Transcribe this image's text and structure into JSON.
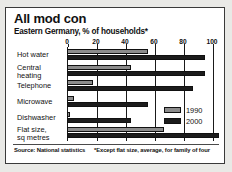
{
  "title": "All mod con",
  "subtitle": "Eastern Germany, % of households*",
  "footer": {
    "source": "Source: National statistics",
    "note": "*Except flat size, average, for family of four"
  },
  "legend": {
    "position": "inside-right",
    "items": [
      {
        "label": "1990",
        "color": "#8c8c8c"
      },
      {
        "label": "2000",
        "color": "#1c1c1c"
      }
    ]
  },
  "colors": {
    "series_1990": "#8c8c8c",
    "series_2000": "#1c1c1c",
    "card_background": "#ffffff",
    "page_background": "#e9e9e6",
    "border": "#3a3a3a",
    "axis": "#1a1a1a"
  },
  "chart_data": {
    "type": "bar",
    "orientation": "horizontal",
    "title": "All mod con",
    "subtitle": "Eastern Germany, % of households*",
    "xlabel": "",
    "ylabel": "",
    "xlim": [
      0,
      100
    ],
    "ticks": [
      "0",
      "20",
      "40",
      "60",
      "80",
      "100"
    ],
    "tick_values": [
      0,
      20,
      40,
      60,
      80,
      100
    ],
    "grid": true,
    "categories": [
      "Hot water",
      "Central\nheating",
      "Telephone",
      "Microwave",
      "Dishwasher",
      "Flat size,\nsq metres"
    ],
    "series": [
      {
        "name": "1990",
        "values": [
          56,
          44,
          18,
          5,
          2,
          67
        ]
      },
      {
        "name": "2000",
        "values": [
          95,
          95,
          87,
          56,
          44,
          105
        ]
      }
    ]
  }
}
